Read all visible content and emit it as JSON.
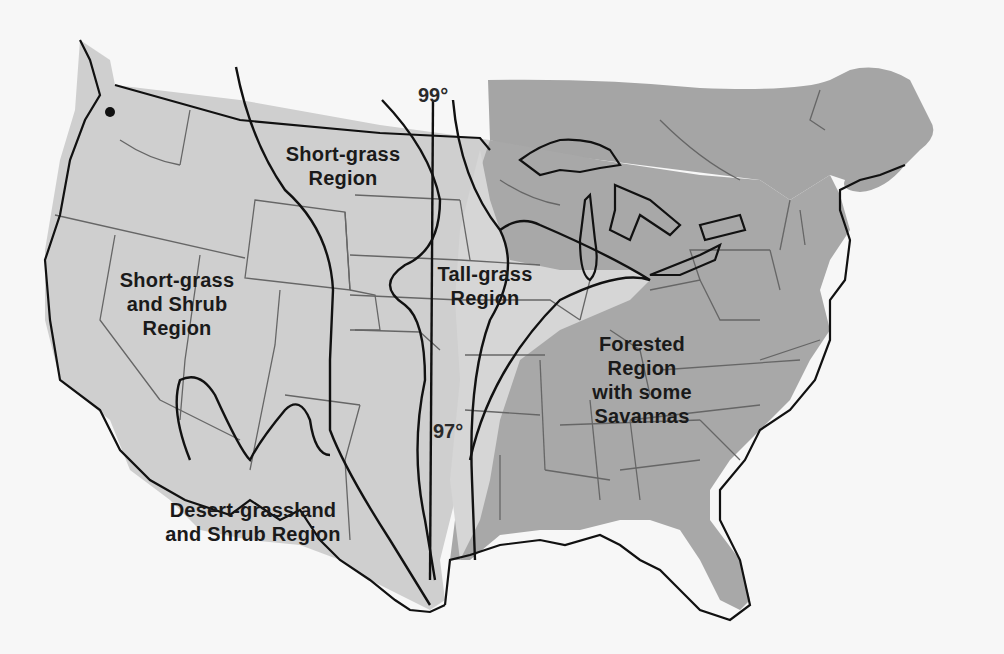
{
  "map": {
    "title": "Grassland and vegetation regions of the United States",
    "colors": {
      "background": "#f7f7f7",
      "grassland_fill": "#cfcfcf",
      "grassland_light": "#d9d9d9",
      "forest_fill": "#a8a8a8",
      "canada_fill": "#a5a5a5",
      "state_lines": "#666666",
      "boundary_lines": "#111111"
    },
    "regions": [
      {
        "id": "short-grass",
        "label_line1": "Short-grass",
        "label_line2": "Region"
      },
      {
        "id": "short-grass-shrub",
        "label_line1": "Short-grass",
        "label_line2": "and Shrub",
        "label_line3": "Region"
      },
      {
        "id": "tall-grass",
        "label_line1": "Tall-grass",
        "label_line2": "Region"
      },
      {
        "id": "desert-grassland",
        "label_line1": "Desert-grassland",
        "label_line2": "and Shrub Region"
      },
      {
        "id": "forested",
        "label_line1": "Forested Region",
        "label_line2": "with some",
        "label_line3": "Savannas"
      }
    ],
    "meridians": [
      {
        "label": "99°"
      },
      {
        "label": "97°"
      }
    ]
  }
}
